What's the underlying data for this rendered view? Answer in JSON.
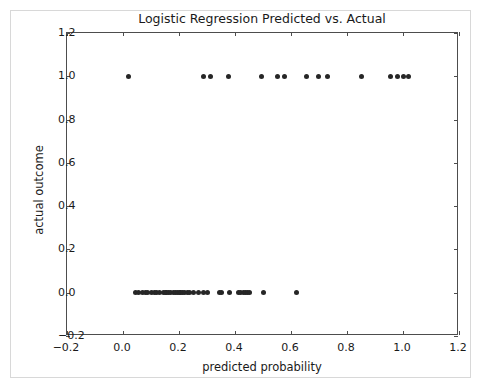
{
  "figure": {
    "title": "Logistic Regression Predicted vs. Actual",
    "xlabel": "predicted probability",
    "ylabel": "actual outcome",
    "point_color": "#262626",
    "axis_color": "#4d4d4d",
    "background": "#ffffff"
  },
  "axes": {
    "x_ticks": [
      "-0.2",
      "0.0",
      "0.2",
      "0.4",
      "0.6",
      "0.8",
      "1.0",
      "1.2"
    ],
    "x_tick_values": [
      -0.2,
      0.0,
      0.2,
      0.4,
      0.6,
      0.8,
      1.0,
      1.2
    ],
    "y_ticks": [
      "-0.2",
      "0.0",
      "0.2",
      "0.4",
      "0.6",
      "0.8",
      "1.0",
      "1.2"
    ],
    "y_tick_values": [
      -0.2,
      0.0,
      0.2,
      0.4,
      0.6,
      0.8,
      1.0,
      1.2
    ]
  },
  "chart_data": {
    "type": "scatter",
    "title": "Logistic Regression Predicted vs. Actual",
    "xlabel": "predicted probability",
    "ylabel": "actual outcome",
    "xlim": [
      -0.2,
      1.2
    ],
    "ylim": [
      -0.2,
      1.2
    ],
    "grid": false,
    "legend": null,
    "marker": "circle",
    "marker_color": "#262626",
    "marker_size": 5,
    "series": [
      {
        "name": "observations",
        "x": [
          0.018,
          0.286,
          0.311,
          0.375,
          0.493,
          0.55,
          0.575,
          0.654,
          0.697,
          0.732,
          0.85,
          0.957,
          0.979,
          1.0,
          1.021,
          0.045,
          0.057,
          0.068,
          0.079,
          0.089,
          0.1,
          0.111,
          0.121,
          0.132,
          0.143,
          0.15,
          0.157,
          0.164,
          0.171,
          0.179,
          0.186,
          0.193,
          0.2,
          0.207,
          0.214,
          0.221,
          0.229,
          0.236,
          0.25,
          0.268,
          0.286,
          0.3,
          0.343,
          0.35,
          0.379,
          0.414,
          0.421,
          0.429,
          0.436,
          0.443,
          0.45,
          0.5,
          0.618
        ],
        "y": [
          1,
          1,
          1,
          1,
          1,
          1,
          1,
          1,
          1,
          1,
          1,
          1,
          1,
          1,
          1,
          0,
          0,
          0,
          0,
          0,
          0,
          0,
          0,
          0,
          0,
          0,
          0,
          0,
          0,
          0,
          0,
          0,
          0,
          0,
          0,
          0,
          0,
          0,
          0,
          0,
          0,
          0,
          0,
          0,
          0,
          0,
          0,
          0,
          0,
          0,
          0,
          0,
          0
        ]
      }
    ]
  }
}
